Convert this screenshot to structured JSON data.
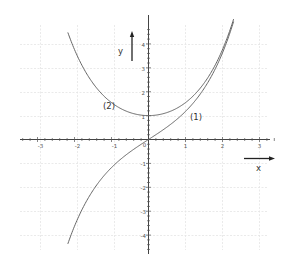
{
  "chart_data": {
    "type": "line",
    "title": "",
    "xlabel": "x",
    "ylabel": "y",
    "xlim": [
      -3.5,
      3.5
    ],
    "ylim": [
      -4.6,
      4.6
    ],
    "grid": true,
    "legend": "inline labels",
    "x_ticks": [
      -3,
      -2,
      -1,
      0,
      1,
      2,
      3
    ],
    "x_tick_labels": [
      "-3",
      "-2",
      "-1",
      "0",
      "1",
      "2",
      "3"
    ],
    "y_ticks": [
      -4,
      -3,
      -2,
      -1,
      1,
      2,
      3,
      4
    ],
    "y_tick_labels": [
      "-4",
      "-3",
      "-2",
      "-1",
      "1",
      "2",
      "3",
      "4"
    ],
    "series": [
      {
        "name": "(1)",
        "function": "sinh(x)",
        "x": [
          -2.2,
          -2.0,
          -1.5,
          -1.0,
          -0.5,
          0,
          0.5,
          1.0,
          1.5,
          2.0,
          2.3
        ],
        "values": [
          -4.46,
          -3.63,
          -2.13,
          -1.18,
          -0.52,
          0,
          0.52,
          1.18,
          2.13,
          3.63,
          4.94
        ]
      },
      {
        "name": "(2)",
        "function": "cosh(x)",
        "x": [
          -2.2,
          -2.0,
          -1.5,
          -1.0,
          -0.5,
          0,
          0.5,
          1.0,
          1.5,
          2.0,
          2.3
        ],
        "values": [
          4.57,
          3.76,
          2.35,
          1.54,
          1.13,
          1.0,
          1.13,
          1.54,
          2.35,
          3.76,
          5.04
        ]
      }
    ],
    "annotations": [
      {
        "text": "(1)",
        "near": "sinh curve, x≈1.2"
      },
      {
        "text": "(2)",
        "near": "cosh curve, x≈-1.2"
      }
    ]
  },
  "labels": {
    "x_axis": "x",
    "y_axis": "y",
    "curve1": "(1)",
    "curve2": "(2)"
  },
  "ticks": {
    "x": [
      "-3",
      "-2",
      "-1",
      "0",
      "1",
      "2",
      "3"
    ],
    "y_pos": [
      "1",
      "2",
      "3",
      "4"
    ],
    "y_neg": [
      "-1",
      "-2",
      "-3",
      "-4"
    ]
  },
  "colors": {
    "curve": "#666666",
    "axis": "#444444",
    "grid": "#e4e4e4"
  }
}
